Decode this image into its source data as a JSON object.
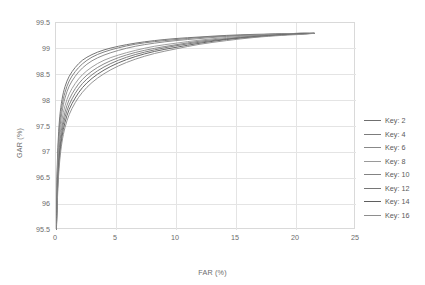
{
  "chart_data": {
    "type": "line",
    "title": "",
    "xlabel": "FAR (%)",
    "ylabel": "GAR (%)",
    "xlim": [
      0,
      25
    ],
    "ylim": [
      95.5,
      99.5
    ],
    "xticks": [
      "0",
      "5",
      "10",
      "15",
      "20",
      "25"
    ],
    "yticks": [
      "95.5",
      "96",
      "96.5",
      "97",
      "97.5",
      "98",
      "98.5",
      "99",
      "99.5"
    ],
    "grid": true,
    "legend_position": "right-outside",
    "series": [
      {
        "name": "Key: 2",
        "color": "#6f6f6f",
        "x": [
          0.02,
          0.06,
          0.12,
          0.2,
          0.32,
          0.5,
          0.75,
          1.1,
          1.6,
          2.2,
          3.0,
          4.0,
          5.2,
          6.6,
          8.2,
          10.0,
          12.0,
          14.2,
          16.5,
          18.8,
          20.4,
          21.5
        ],
        "y": [
          95.5,
          96.2,
          96.85,
          97.3,
          97.7,
          98.02,
          98.27,
          98.47,
          98.64,
          98.78,
          98.89,
          98.98,
          99.05,
          99.11,
          99.16,
          99.2,
          99.23,
          99.26,
          99.28,
          99.29,
          99.3,
          99.3
        ]
      },
      {
        "name": "Key: 4",
        "color": "#7c7c7c",
        "x": [
          0.02,
          0.06,
          0.12,
          0.2,
          0.32,
          0.5,
          0.75,
          1.1,
          1.6,
          2.2,
          3.0,
          4.0,
          5.2,
          6.6,
          8.2,
          10.0,
          12.0,
          14.2,
          16.5,
          18.8,
          20.4,
          21.5
        ],
        "y": [
          95.5,
          96.1,
          96.72,
          97.18,
          97.58,
          97.9,
          98.16,
          98.38,
          98.56,
          98.71,
          98.84,
          98.94,
          99.02,
          99.09,
          99.14,
          99.18,
          99.22,
          99.25,
          99.27,
          99.29,
          99.3,
          99.3
        ]
      },
      {
        "name": "Key: 6",
        "color": "#888888",
        "x": [
          0.02,
          0.06,
          0.12,
          0.2,
          0.32,
          0.5,
          0.75,
          1.1,
          1.6,
          2.2,
          3.0,
          4.0,
          5.2,
          6.6,
          8.2,
          10.0,
          12.0,
          14.2,
          16.5,
          18.8,
          20.4,
          21.5
        ],
        "y": [
          95.5,
          96.0,
          96.6,
          97.05,
          97.45,
          97.78,
          98.05,
          98.28,
          98.47,
          98.63,
          98.77,
          98.88,
          98.97,
          99.05,
          99.11,
          99.16,
          99.2,
          99.24,
          99.27,
          99.29,
          99.3,
          99.3
        ]
      },
      {
        "name": "Key: 8",
        "color": "#9a9a9a",
        "x": [
          0.02,
          0.06,
          0.12,
          0.2,
          0.32,
          0.5,
          0.75,
          1.1,
          1.6,
          2.2,
          3.0,
          4.0,
          5.2,
          6.6,
          8.2,
          10.0,
          12.0,
          14.2,
          16.5,
          18.8,
          20.4,
          21.5
        ],
        "y": [
          95.5,
          95.92,
          96.48,
          96.92,
          97.3,
          97.63,
          97.9,
          98.13,
          98.33,
          98.5,
          98.65,
          98.78,
          98.88,
          98.97,
          99.05,
          99.11,
          99.17,
          99.22,
          99.26,
          99.28,
          99.3,
          99.3
        ]
      },
      {
        "name": "Key: 10",
        "color": "#838383",
        "x": [
          0.02,
          0.06,
          0.12,
          0.2,
          0.32,
          0.5,
          0.75,
          1.1,
          1.6,
          2.2,
          3.0,
          4.0,
          5.2,
          6.6,
          8.2,
          10.0,
          12.0,
          14.2,
          16.5,
          18.8,
          20.4,
          21.5
        ],
        "y": [
          95.5,
          95.85,
          96.38,
          96.8,
          97.18,
          97.5,
          97.78,
          98.02,
          98.23,
          98.41,
          98.57,
          98.71,
          98.83,
          98.93,
          99.01,
          99.08,
          99.15,
          99.2,
          99.25,
          99.28,
          99.29,
          99.3
        ]
      },
      {
        "name": "Key: 12",
        "color": "#767676",
        "x": [
          0.02,
          0.06,
          0.12,
          0.2,
          0.32,
          0.5,
          0.75,
          1.1,
          1.6,
          2.2,
          3.0,
          4.0,
          5.2,
          6.6,
          8.2,
          10.0,
          12.0,
          14.2,
          16.5,
          18.8,
          20.4,
          21.5
        ],
        "y": [
          95.5,
          95.78,
          96.28,
          96.7,
          97.07,
          97.4,
          97.68,
          97.92,
          98.14,
          98.33,
          98.5,
          98.65,
          98.78,
          98.89,
          98.98,
          99.06,
          99.13,
          99.19,
          99.24,
          99.27,
          99.29,
          99.3
        ]
      },
      {
        "name": "Key: 14",
        "color": "#5f5f5f",
        "x": [
          0.02,
          0.06,
          0.12,
          0.2,
          0.32,
          0.5,
          0.75,
          1.1,
          1.6,
          2.2,
          3.0,
          4.0,
          5.2,
          6.6,
          8.2,
          10.0,
          12.0,
          14.2,
          16.5,
          18.8,
          20.4,
          21.5
        ],
        "y": [
          95.5,
          95.72,
          96.2,
          96.6,
          96.97,
          97.3,
          97.58,
          97.83,
          98.05,
          98.25,
          98.43,
          98.59,
          98.73,
          98.85,
          98.95,
          99.03,
          99.11,
          99.18,
          99.23,
          99.27,
          99.29,
          99.3
        ]
      },
      {
        "name": "Key: 16",
        "color": "#8e8e8e",
        "x": [
          0.02,
          0.06,
          0.12,
          0.2,
          0.32,
          0.5,
          0.75,
          1.1,
          1.6,
          2.2,
          3.0,
          4.0,
          5.2,
          6.6,
          8.2,
          10.0,
          12.0,
          14.2,
          16.5,
          18.8,
          20.4,
          21.5
        ],
        "y": [
          95.5,
          95.65,
          96.1,
          96.5,
          96.86,
          97.2,
          97.48,
          97.73,
          97.96,
          98.16,
          98.35,
          98.52,
          98.67,
          98.8,
          98.91,
          99.0,
          99.09,
          99.16,
          99.22,
          99.26,
          99.28,
          99.3
        ]
      }
    ]
  },
  "legend": {
    "items": [
      {
        "label": "Key: 2"
      },
      {
        "label": "Key: 4"
      },
      {
        "label": "Key: 6"
      },
      {
        "label": "Key: 8"
      },
      {
        "label": "Key: 10"
      },
      {
        "label": "Key: 12"
      },
      {
        "label": "Key: 14"
      },
      {
        "label": "Key: 16"
      }
    ]
  }
}
